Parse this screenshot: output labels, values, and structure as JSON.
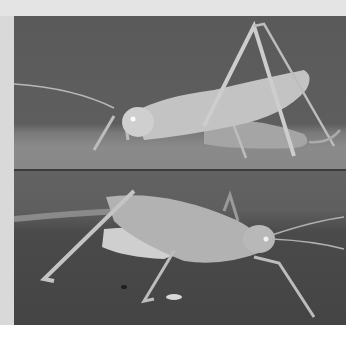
{
  "image": {
    "description": "Two stacked grayscale photographs of a katydid / bush cricket",
    "panels": [
      {
        "id": "top",
        "subject": "katydid side view, facing left, resting on surface"
      },
      {
        "id": "bottom",
        "subject": "katydid side view, facing right, on textured ground"
      }
    ]
  },
  "colors": {
    "background": "#ffffff",
    "margin": "#e4e4e4",
    "photo_bg_top": "#5a5a5a",
    "photo_bg_bottom": "#4a4a4a",
    "insect": "#c8c8c8"
  }
}
